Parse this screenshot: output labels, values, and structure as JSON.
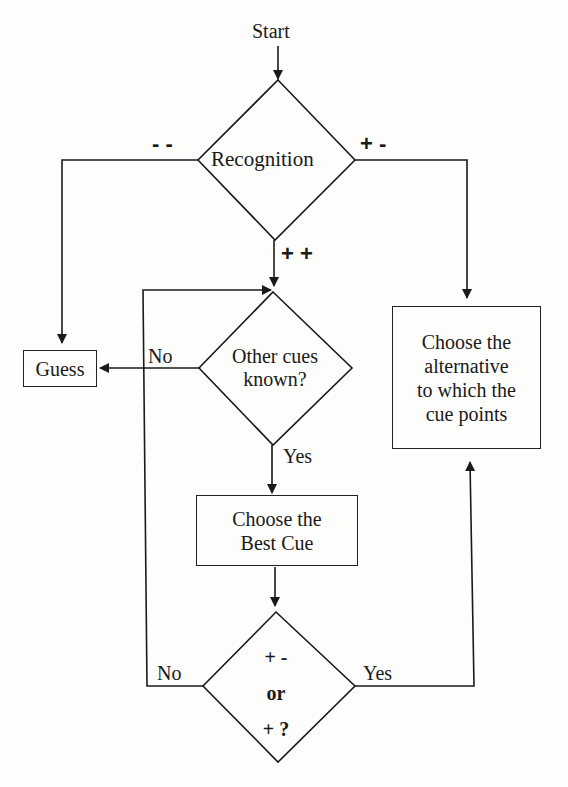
{
  "diagram": {
    "type": "flowchart",
    "start_label": "Start",
    "nodes": {
      "recognition": {
        "label": "Recognition",
        "shape": "diamond"
      },
      "other_cues": {
        "label_line1": "Other cues",
        "label_line2": "known?",
        "shape": "diamond"
      },
      "guess": {
        "label": "Guess",
        "shape": "box"
      },
      "choose_alternative": {
        "label_lines": [
          "Choose the",
          "alternative",
          "to which the",
          "cue points"
        ],
        "shape": "box"
      },
      "choose_best_cue": {
        "label_lines": [
          "Choose the",
          "Best Cue"
        ],
        "shape": "box"
      },
      "cue_test": {
        "label_lines": [
          "+ -",
          "or",
          "+ ?"
        ],
        "shape": "diamond"
      }
    },
    "edges": {
      "recognition_left": "- -",
      "recognition_right": "+ -",
      "recognition_down": "+ +",
      "other_cues_no": "No",
      "other_cues_yes": "Yes",
      "cue_test_no": "No",
      "cue_test_yes": "Yes"
    }
  }
}
